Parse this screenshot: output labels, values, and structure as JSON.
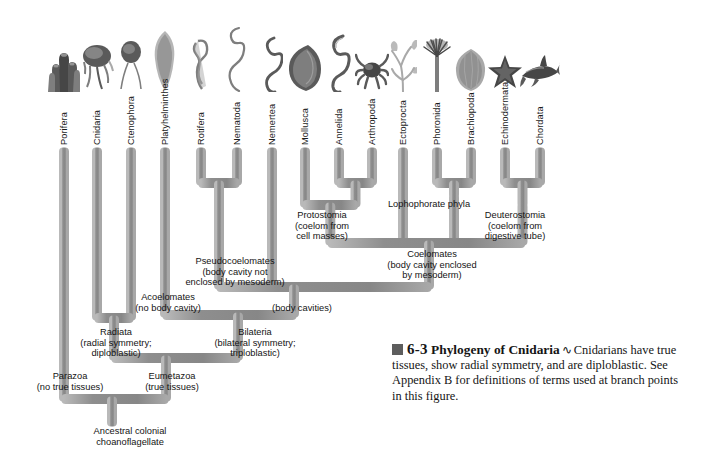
{
  "figure": {
    "background_color": "#ffffff",
    "branch_color": "#8c8c8c",
    "branch_edge_light": "#b5b5b5",
    "branch_edge_dark": "#6f6f6f"
  },
  "taxa": [
    {
      "name": "Porifera",
      "icon": "sponge-illustration",
      "x": 55
    },
    {
      "name": "Cnidaria",
      "icon": "jellyfish-illustration",
      "x": 88
    },
    {
      "name": "Ctenophora",
      "icon": "comb-jelly-illustration",
      "x": 122
    },
    {
      "name": "Platyhelminthes",
      "icon": "flatworm-illustration",
      "x": 156
    },
    {
      "name": "Rotifera",
      "icon": "rotifer-illustration",
      "x": 192
    },
    {
      "name": "Nematoda",
      "icon": "roundworm-illustration",
      "x": 228
    },
    {
      "name": "Nemertea",
      "icon": "ribbon-worm-illustration",
      "x": 263
    },
    {
      "name": "Mollusca",
      "icon": "clam-illustration",
      "x": 296
    },
    {
      "name": "Annelida",
      "icon": "segmented-worm-illustration",
      "x": 330
    },
    {
      "name": "Arthropoda",
      "icon": "crab-illustration",
      "x": 363
    },
    {
      "name": "Ectoprocta",
      "icon": "bryozoan-illustration",
      "x": 394
    },
    {
      "name": "Phoronida",
      "icon": "phoronid-illustration",
      "x": 428
    },
    {
      "name": "Brachiopoda",
      "icon": "lamp-shell-illustration",
      "x": 462
    },
    {
      "name": "Echinodermata",
      "icon": "sea-star-illustration",
      "x": 496
    },
    {
      "name": "Chordata",
      "icon": "shark-illustration",
      "x": 531
    }
  ],
  "nodes": {
    "protostomia": "Protostomia\n(coelom from\ncell masses)",
    "lophophorate": "Lophophorate phyla",
    "deuterostomia": "Deuterostomia\n(coelom from\ndigestive tube)",
    "coelomates": "Coelomates\n(body cavity enclosed\nby mesoderm)",
    "pseudocoelomates": "Pseudocoelomates\n(body cavity not\nenclosed by mesoderm)",
    "acoelomates": "Acoelomates\n(no body cavity)",
    "body_cavities": "(body cavities)",
    "radiata": "Radiata\n(radial symmetry;\ndiploblastic)",
    "bilateria": "Bilateria\n(bilateral symmetry;\ntriploblastic)",
    "parazoa": "Parazoa\n(no true tissues)",
    "eumetazoa": "Eumetazoa\n(true tissues)",
    "root": "Ancestral colonial\nchoanoflagellate"
  },
  "caption": {
    "marker_icon": "filled-square-marker",
    "number": "6-3",
    "title": "Phylogeny of Cnidaria",
    "tilde": "∿",
    "body": "Cnidarians have true tissues, show radial symmetry, and are diploblastic. See Appendix B for definitions of terms used at branch points in this figure."
  }
}
